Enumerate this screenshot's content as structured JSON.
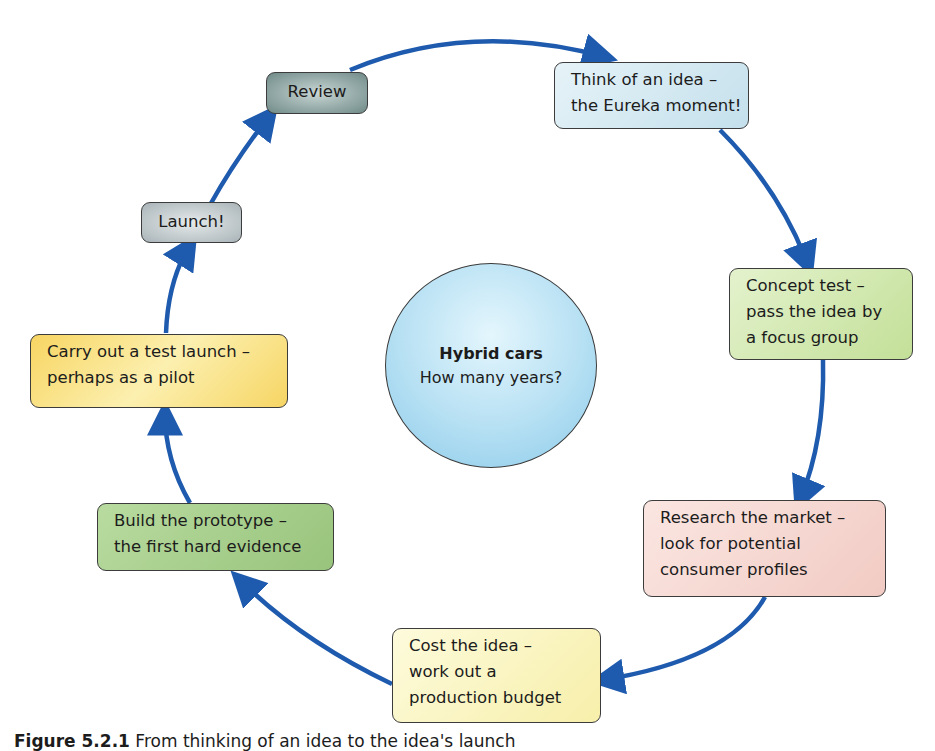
{
  "center": {
    "title": "Hybrid cars",
    "subtitle": "How many years?"
  },
  "steps": [
    {
      "id": "idea",
      "lines": [
        "Think of an idea –",
        "the Eureka moment!"
      ],
      "color": "#cde6f0"
    },
    {
      "id": "concept",
      "lines": [
        "Concept test –",
        "pass the idea by",
        "a focus group"
      ],
      "color": "#cfe6a8"
    },
    {
      "id": "research",
      "lines": [
        "Research the market –",
        "look for potential",
        "consumer profiles"
      ],
      "color": "#f6d6d0"
    },
    {
      "id": "cost",
      "lines": [
        "Cost the idea –",
        "work out a",
        "production budget"
      ],
      "color": "#fbf6c2"
    },
    {
      "id": "prototype",
      "lines": [
        "Build the prototype –",
        "the first hard evidence"
      ],
      "color": "#a8cf8e"
    },
    {
      "id": "test-launch",
      "lines": [
        "Carry out a test launch –",
        "perhaps as a pilot"
      ],
      "color": "#f9dc70"
    },
    {
      "id": "launch",
      "lines": [
        "Launch!"
      ],
      "color": "#b9c3c6"
    },
    {
      "id": "review",
      "lines": [
        "Review"
      ],
      "color": "#8fa5a3"
    }
  ],
  "arrow_color": "#1e5aad",
  "caption": {
    "figure_label": "Figure 5.2.1",
    "text": "From thinking of an idea to the idea's launch"
  }
}
